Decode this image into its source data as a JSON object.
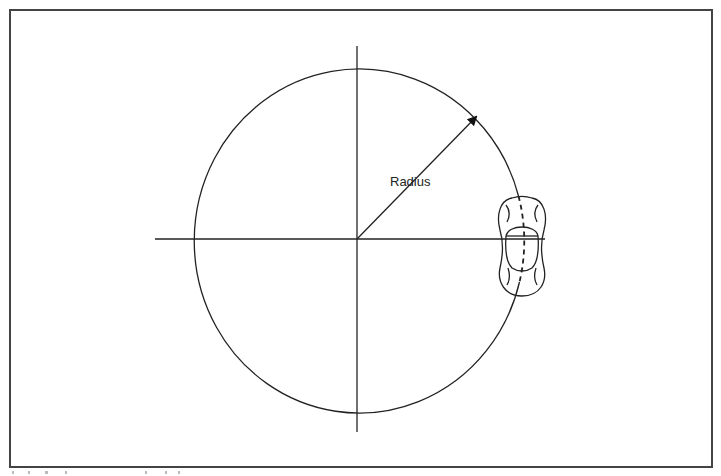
{
  "diagram": {
    "type": "turning-radius-illustration",
    "labels": {
      "radius": "Radius"
    },
    "elements": {
      "circle": {
        "cx": 357,
        "cy": 239,
        "rx": 165,
        "ry": 172
      },
      "vertical_axis": {
        "x": 357,
        "y1": 46,
        "y2": 432
      },
      "horizontal_axis": {
        "y": 239,
        "x1": 155,
        "x2": 545
      },
      "radius_arrow": {
        "x1": 357,
        "y1": 239,
        "x2": 478,
        "y2": 115
      },
      "vehicle": {
        "cx": 522,
        "cy": 239,
        "orientation": "top-down"
      }
    },
    "colors": {
      "stroke": "#222222",
      "frame": "#444444",
      "background": "#ffffff"
    }
  }
}
